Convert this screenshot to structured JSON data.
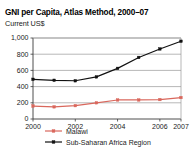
{
  "chart_data": {
    "type": "line",
    "title": "GNI per Capita, Atlas Method, 2000–07",
    "subtitle": "Current US$",
    "xlabel": "",
    "ylabel": "",
    "x": [
      2000,
      2001,
      2002,
      2003,
      2004,
      2005,
      2006,
      2007
    ],
    "categories": [
      "2000",
      "2001",
      "2002",
      "2003",
      "2004",
      "2005",
      "2006",
      "2007"
    ],
    "xtick_labels": [
      "2000",
      "2002",
      "2004",
      "2006",
      "2007"
    ],
    "xtick_values": [
      2000,
      2002,
      2004,
      2006,
      2007
    ],
    "ytick_labels": [
      "0",
      "200",
      "400",
      "600",
      "800",
      "1,000"
    ],
    "ytick_values": [
      0,
      200,
      400,
      600,
      800,
      1000
    ],
    "ylim": [
      0,
      1000
    ],
    "xlim": [
      2000,
      2007
    ],
    "grid": true,
    "legend_position": "bottom",
    "series": [
      {
        "name": "Malawi",
        "color": "#d9675c",
        "marker": "square",
        "values": [
          160,
          150,
          165,
          200,
          235,
          235,
          240,
          265
        ]
      },
      {
        "name": "Sub-Saharan Africa Region",
        "color": "#111111",
        "marker": "square",
        "values": [
          490,
          478,
          472,
          520,
          625,
          760,
          865,
          960
        ]
      }
    ]
  },
  "legend": {
    "items": [
      {
        "label": "Malawi",
        "color": "#d9675c"
      },
      {
        "label": "Sub-Saharan Africa Region",
        "color": "#111111"
      }
    ]
  }
}
